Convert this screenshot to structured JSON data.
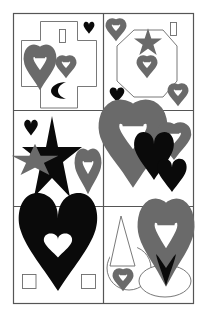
{
  "figure": {
    "title": "",
    "layout": {
      "rows": 3,
      "cols": 2
    },
    "colors": {
      "background": "#ffffff",
      "grid_line": "#555555",
      "outline": "#6a6a6a",
      "solid_fill": "#0a0a0a"
    },
    "panels": [
      {
        "id": 1,
        "row": 1,
        "col": 1,
        "label": "Cross shape with hearts, rectangle and crescent",
        "elements": [
          "cross-outline",
          "rectangle-outline",
          "heart-solid-small",
          "heart-outline-large",
          "heart-outline-small",
          "crescent-solid"
        ]
      },
      {
        "id": 2,
        "row": 1,
        "col": 2,
        "label": "Octagon with star and hearts",
        "elements": [
          "octagon-outline",
          "star-outline-small",
          "heart-outline-center",
          "heart-outline-top-left",
          "rectangle-outline",
          "heart-solid-bottom-left",
          "heart-outline-bottom-right"
        ]
      },
      {
        "id": 3,
        "row": 2,
        "col": 1,
        "label": "Large solid star with small star and hearts",
        "elements": [
          "star-solid-large",
          "star-outline-small",
          "heart-solid-small",
          "heart-outline-tall"
        ]
      },
      {
        "id": 4,
        "row": 2,
        "col": 2,
        "label": "Overlapping hearts",
        "elements": [
          "heart-outline-large",
          "heart-outline-small",
          "heart-solid-medium",
          "heart-solid-small"
        ]
      },
      {
        "id": 5,
        "row": 3,
        "col": 1,
        "label": "Large solid heart with white heart inside and two squares",
        "elements": [
          "heart-solid-large",
          "heart-white-inner",
          "square-outline-left",
          "square-outline-right"
        ]
      },
      {
        "id": 6,
        "row": 3,
        "col": 2,
        "label": "Triangle, circle, ellipse and hearts",
        "elements": [
          "triangle-outline",
          "circle-outline",
          "heart-outline-small",
          "heart-outline-large",
          "heart-solid-tip",
          "ellipse-outline"
        ]
      }
    ]
  }
}
